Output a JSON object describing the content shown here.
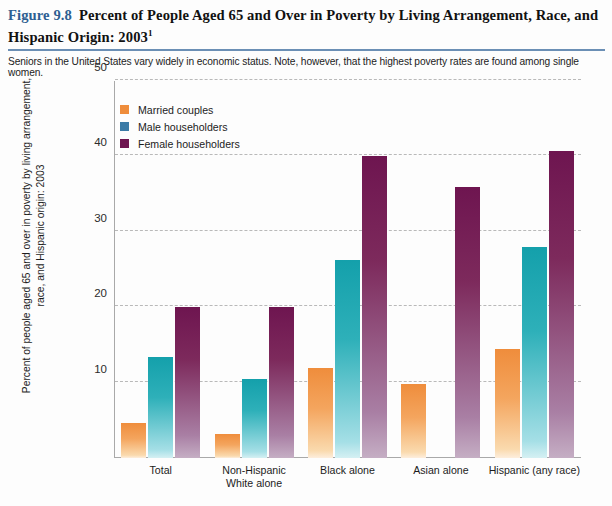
{
  "header": {
    "figure_number": "Figure 9.8",
    "title": "Percent of People Aged 65 and Over in Poverty by Living Arrangement, Race, and Hispanic Origin: 2003",
    "title_superscript": "1",
    "subtitle": "Seniors in the United States vary widely in economic status. Note, however, that the highest poverty rates are found among single women.",
    "accent_color": "#2e5f92",
    "rule_color": "#6b8fb5"
  },
  "legend": {
    "position": "top-left-inside",
    "items": [
      {
        "label": "Married couples",
        "color": "#ef8d3c"
      },
      {
        "label": "Male householders",
        "color": "#3b7ba6"
      },
      {
        "label": "Female householders",
        "color": "#6e1550"
      }
    ]
  },
  "chart_data": {
    "type": "bar",
    "title": "Percent of People Aged 65 and Over in Poverty by Living Arrangement, Race, and Hispanic Origin: 2003",
    "xlabel": "",
    "ylabel": "Percent of people aged 65 and over in poverty by living arrangement, race, and Hispanic origin: 2003",
    "ylabel_line1": "Percent of people aged 65 and over in poverty",
    "ylabel_line2": "by living arrangement, race, and Hispanic origin: 2003",
    "ylim": [
      0,
      50
    ],
    "yticks": [
      10,
      20,
      30,
      40,
      50
    ],
    "grid": true,
    "grid_style": "dashed",
    "categories": [
      "Total",
      "Non-Hispanic White alone",
      "Black alone",
      "Asian alone",
      "Hispanic (any race)"
    ],
    "category_lines": [
      [
        "Total"
      ],
      [
        "Non-Hispanic",
        "White alone"
      ],
      [
        "Black alone"
      ],
      [
        "Asian alone"
      ],
      [
        "Hispanic (any race)"
      ]
    ],
    "series": [
      {
        "name": "Married couples",
        "color": "#ef8d3c",
        "values": [
          4.6,
          3.2,
          12.0,
          9.8,
          14.4
        ]
      },
      {
        "name": "Male householders",
        "color": "#14a0ab",
        "values": [
          13.4,
          10.5,
          26.2,
          null,
          28.0
        ]
      },
      {
        "name": "Female householders",
        "color": "#6e1550",
        "values": [
          20.0,
          20.0,
          40.1,
          36.0,
          40.7
        ]
      }
    ]
  }
}
